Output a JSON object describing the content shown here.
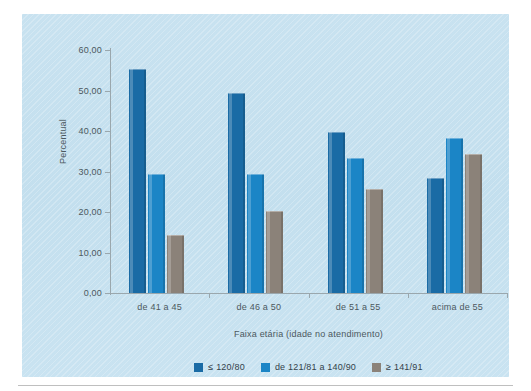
{
  "chart_data": {
    "type": "bar",
    "title": "",
    "subtitle": "",
    "xlabel": "Faixa etária (idade no atendimento)",
    "ylabel": "Percentual",
    "categories": [
      "de 41 a 45",
      "de 46 a 50",
      "de 51 a 55",
      "acima de 55"
    ],
    "series": [
      {
        "name": "≤ 120/80",
        "color": "#1a6ba5",
        "values": [
          55.3,
          49.4,
          39.7,
          28.3
        ]
      },
      {
        "name": "de 121/81 a 140/90",
        "color": "#1b85c6",
        "values": [
          29.4,
          29.4,
          33.4,
          38.2
        ]
      },
      {
        "name": "≥ 141/91",
        "color": "#8b8279",
        "values": [
          14.3,
          20.2,
          25.7,
          34.3
        ]
      }
    ],
    "ylim": [
      0,
      60
    ],
    "ytick_values": [
      0,
      10,
      20,
      30,
      40,
      50,
      60
    ],
    "ytick_labels": [
      "0,00",
      "10,00",
      "20,00",
      "30,00",
      "40,00",
      "50,00",
      "60,00"
    ],
    "grid": false,
    "legend_position": "bottom",
    "panel_background": "#c6e1ef",
    "axis_color": "#9aa7ad",
    "text_color": "#4c585e"
  }
}
